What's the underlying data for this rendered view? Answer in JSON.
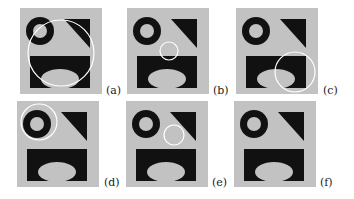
{
  "figure": {
    "colors": {
      "background": "#c2c2c2",
      "shape": "#111111",
      "highlight": "#ffffff"
    },
    "panels": [
      {
        "id": "a",
        "label": "(a)",
        "x": 20,
        "y": 8,
        "label_x": 106,
        "label_y": 84,
        "circle": {
          "cx": 41,
          "cy": 45,
          "r": 33
        }
      },
      {
        "id": "b",
        "label": "(b)",
        "x": 127,
        "y": 8,
        "label_x": 213,
        "label_y": 84,
        "circle": {
          "cx": 42,
          "cy": 43,
          "r": 9
        }
      },
      {
        "id": "c",
        "label": "(c)",
        "x": 236,
        "y": 8,
        "label_x": 323,
        "label_y": 84,
        "circle": {
          "cx": 59,
          "cy": 64,
          "r": 20
        }
      },
      {
        "id": "d",
        "label": "(d)",
        "x": 17,
        "y": 101,
        "label_x": 104,
        "label_y": 176,
        "circle": {
          "cx": 22,
          "cy": 21,
          "r": 18
        }
      },
      {
        "id": "e",
        "label": "(e)",
        "x": 126,
        "y": 101,
        "label_x": 212,
        "label_y": 176,
        "circle": {
          "cx": 48,
          "cy": 34,
          "r": 10
        }
      },
      {
        "id": "f",
        "label": "(f)",
        "x": 234,
        "y": 101,
        "label_x": 320,
        "label_y": 176,
        "circle": null
      }
    ]
  }
}
